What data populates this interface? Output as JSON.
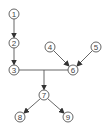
{
  "diagram": {
    "type": "directed-graph",
    "colors": {
      "stroke": "#555555",
      "text": "#444444",
      "background": "#ffffff"
    },
    "nodes": [
      {
        "id": "1",
        "label": "1",
        "x": 14,
        "y": 14
      },
      {
        "id": "2",
        "label": "2",
        "x": 14,
        "y": 43
      },
      {
        "id": "3",
        "label": "3",
        "x": 14,
        "y": 70
      },
      {
        "id": "4",
        "label": "4",
        "x": 50,
        "y": 47
      },
      {
        "id": "5",
        "label": "5",
        "x": 96,
        "y": 47
      },
      {
        "id": "6",
        "label": "6",
        "x": 73,
        "y": 70
      },
      {
        "id": "7",
        "label": "7",
        "x": 44,
        "y": 95
      },
      {
        "id": "8",
        "label": "8",
        "x": 20,
        "y": 117
      },
      {
        "id": "9",
        "label": "9",
        "x": 68,
        "y": 117
      }
    ],
    "edges": [
      {
        "from": "1",
        "to": "2",
        "arrow": true
      },
      {
        "from": "2",
        "to": "3",
        "arrow": true
      },
      {
        "from": "4",
        "to": "6",
        "arrow": true
      },
      {
        "from": "5",
        "to": "6",
        "arrow": true
      },
      {
        "from": "3",
        "to": "6",
        "arrow": false,
        "note": "horizontal bar joining 3 and 6"
      },
      {
        "from": "bar-3-6",
        "to": "7",
        "arrow": true,
        "note": "merge junction at x=44 down to 7"
      },
      {
        "from": "7",
        "to": "8",
        "arrow": true
      },
      {
        "from": "7",
        "to": "9",
        "arrow": true
      }
    ]
  }
}
